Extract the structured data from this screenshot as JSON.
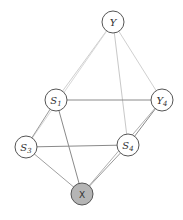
{
  "diagram": {
    "type": "graph",
    "nodes": [
      {
        "id": "Y",
        "label": "Y",
        "sub": "",
        "x": 113,
        "y": 22,
        "fill": "#ffffff"
      },
      {
        "id": "S1",
        "label": "S",
        "sub": "1",
        "x": 56,
        "y": 100,
        "fill": "#ffffff"
      },
      {
        "id": "Y4",
        "label": "Y",
        "sub": "4",
        "x": 162,
        "y": 100,
        "fill": "#ffffff"
      },
      {
        "id": "S3",
        "label": "S",
        "sub": "3",
        "x": 26,
        "y": 147,
        "fill": "#ffffff"
      },
      {
        "id": "S4",
        "label": "S",
        "sub": "4",
        "x": 128,
        "y": 145,
        "fill": "#ffffff"
      },
      {
        "id": "X",
        "label": "X",
        "sub": "",
        "x": 82,
        "y": 194,
        "fill": "#b5b5b5"
      }
    ],
    "edges": [
      {
        "from": "Y",
        "to": "S1",
        "color": "#cfcfcf"
      },
      {
        "from": "Y",
        "to": "S3",
        "color": "#d8d8d8"
      },
      {
        "from": "Y",
        "to": "Y4",
        "color": "#d0d0d0"
      },
      {
        "from": "Y",
        "to": "S4",
        "color": "#c8c8c8"
      },
      {
        "from": "S1",
        "to": "Y4",
        "color": "#8a8a8a"
      },
      {
        "from": "S1",
        "to": "S3",
        "color": "#9a9a9a"
      },
      {
        "from": "S1",
        "to": "X",
        "color": "#8a8a8a"
      },
      {
        "from": "S3",
        "to": "S4",
        "color": "#8a8a8a"
      },
      {
        "from": "S3",
        "to": "X",
        "color": "#a0a0a0"
      },
      {
        "from": "S4",
        "to": "X",
        "color": "#9a9a9a"
      },
      {
        "from": "Y4",
        "to": "S4",
        "color": "#8a8a8a"
      },
      {
        "from": "Y4",
        "to": "X",
        "color": "#b0b0b0"
      }
    ],
    "node_radius": 11
  }
}
